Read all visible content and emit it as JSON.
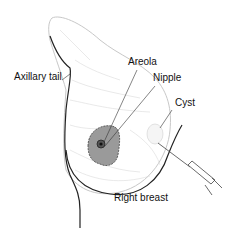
{
  "diagram": {
    "title": "Right breast",
    "labels": {
      "axillary_tail": "Axillary tail",
      "areola": "Areola",
      "nipple": "Nipple",
      "cyst": "Cyst",
      "right_breast": "Right breast"
    },
    "colors": {
      "outline": "#222222",
      "tissue_line": "#bfbfbf",
      "areola_fill": "#9a9a9a",
      "leader_line": "#333333",
      "background": "#ffffff"
    }
  }
}
